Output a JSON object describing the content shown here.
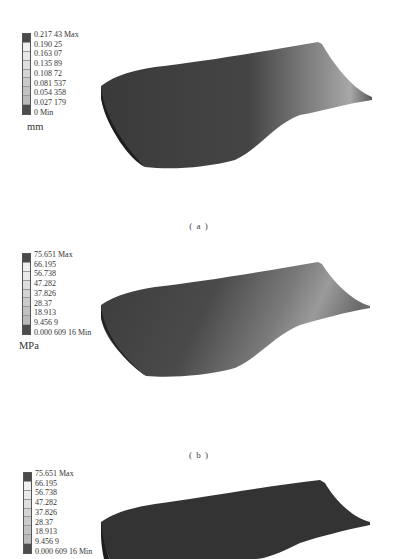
{
  "figure": {
    "panels": [
      {
        "id": "a",
        "caption": "( a )",
        "legend": {
          "unit": "mm",
          "labels": [
            "0.217 43 Max",
            "0.190 25",
            "0.163 07",
            "0.135 89",
            "0.108 72",
            "0.081 537",
            "0.054 358",
            "0.027 179",
            "0 Min"
          ],
          "colors": [
            "#4a4a4a",
            "#f0f0f0",
            "#e8e8e8",
            "#dedede",
            "#d4d4d4",
            "#cacaca",
            "#c2c2c2",
            "#bababa",
            "#4d4d4d"
          ]
        }
      },
      {
        "id": "b",
        "caption": "( b )",
        "legend": {
          "unit": "MPa",
          "labels": [
            "75.651 Max",
            "66.195",
            "56.738",
            "47.282",
            "37.826",
            "28.37",
            "18.913",
            "9.456 9",
            "0.000 609 16 Min"
          ],
          "colors": [
            "#4a4a4a",
            "#f0f0f0",
            "#e8e8e8",
            "#dedede",
            "#d4d4d4",
            "#cacaca",
            "#c2c2c2",
            "#bababa",
            "#4d4d4d"
          ]
        }
      },
      {
        "id": "c",
        "caption": "",
        "legend": {
          "unit": "",
          "labels": [
            "75.651 Max",
            "66.195",
            "56.738",
            "47.282",
            "37.826",
            "28.37",
            "18.913",
            "9.456 9",
            "0.000 609 16 Min"
          ],
          "colors": [
            "#4a4a4a",
            "#f0f0f0",
            "#e8e8e8",
            "#dedede",
            "#d4d4d4",
            "#cacaca",
            "#c2c2c2",
            "#bababa",
            "#4d4d4d"
          ]
        }
      }
    ]
  }
}
